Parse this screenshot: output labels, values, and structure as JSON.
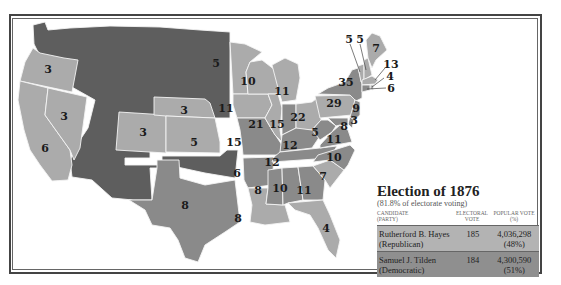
{
  "title": "Election of 1876",
  "subtitle": "(81.8% of electorate voting)",
  "colors": {
    "hayes_republican": "#ababab",
    "tilden_democratic": "#8a8a8a",
    "territories": "#5e5e5e",
    "state_border": "#f4f4f4"
  },
  "legend": {
    "headers": {
      "candidate": "CANDIDATE",
      "party": "(PARTY)",
      "electoral": "ELECTORAL",
      "vote": "VOTE",
      "popular": "POPULAR VOTE",
      "percent": "(%)"
    },
    "rows": [
      {
        "candidate": "Rutherford B. Hayes",
        "party": "(Republican)",
        "electoral": "185",
        "popular": "4,036,298",
        "percent": "(48%)"
      },
      {
        "candidate": "Samuel J. Tilden",
        "party": "(Democratic)",
        "electoral": "184",
        "popular": "4,300,590",
        "percent": "(51%)"
      }
    ]
  },
  "states": {
    "WA": "",
    "OR": "3",
    "CA": "6",
    "NV": "3",
    "CO": "3",
    "NE": "3",
    "KS": "5",
    "TX": "8",
    "MN": "5",
    "IA": "11",
    "MO": "15",
    "AR": "6",
    "LA": "8",
    "WI": "10",
    "IL": "21",
    "MI": "11",
    "IN": "15",
    "OH": "22",
    "KY": "12",
    "TN": "12",
    "MS": "8",
    "AL": "10",
    "GA": "11",
    "FL": "4",
    "SC": "7",
    "NC": "10",
    "VA": "11",
    "WV": "5",
    "PA": "29",
    "NY": "35",
    "NJ": "9",
    "DE": "3",
    "MD": "8",
    "VT": "5",
    "NH": "5",
    "ME": "7",
    "MA": "13",
    "RI": "4",
    "CT": "6"
  }
}
